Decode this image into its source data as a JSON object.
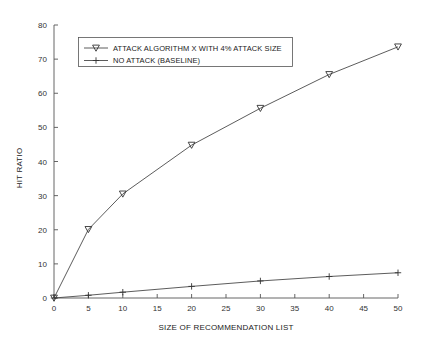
{
  "chart_data": {
    "type": "line",
    "title": "",
    "xlabel": "SIZE OF RECOMMENDATION LIST",
    "ylabel": "HIT RATIO",
    "xlim": [
      0,
      50
    ],
    "ylim": [
      0,
      80
    ],
    "xticks": [
      0,
      5,
      10,
      15,
      20,
      25,
      30,
      35,
      40,
      45,
      50
    ],
    "yticks": [
      0,
      10,
      20,
      30,
      40,
      50,
      60,
      70,
      80
    ],
    "xtick_labels": [
      "0",
      "5",
      "10",
      "15",
      "20",
      "25",
      "30",
      "35",
      "40",
      "45",
      "50"
    ],
    "ytick_labels": [
      "0",
      "10",
      "20",
      "30",
      "40",
      "50",
      "60",
      "70",
      "80"
    ],
    "grid": false,
    "legend_position": "upper-left-inside",
    "series": [
      {
        "name": "ATTACK ALGORITHM X WITH 4% ATTACK SIZE",
        "marker": "triangle-down",
        "x": [
          0,
          5,
          10,
          20,
          30,
          40,
          50
        ],
        "values": [
          0,
          20.1,
          30.5,
          44.8,
          55.6,
          65.5,
          73.6
        ]
      },
      {
        "name": "NO ATTACK (BASELINE)",
        "marker": "plus",
        "x": [
          0,
          5,
          10,
          20,
          30,
          40,
          50
        ],
        "values": [
          0,
          0.8,
          1.7,
          3.4,
          5.0,
          6.3,
          7.4
        ]
      }
    ]
  },
  "legend": {
    "entries": [
      {
        "label": "ATTACK ALGORITHM X WITH 4% ATTACK SIZE",
        "marker": "triangle-down"
      },
      {
        "label": "NO ATTACK (BASELINE)",
        "marker": "plus"
      }
    ]
  },
  "colors": {
    "line": "#4a4a4a",
    "axis": "#555555",
    "text": "#1a1a1a",
    "background": "#ffffff"
  }
}
